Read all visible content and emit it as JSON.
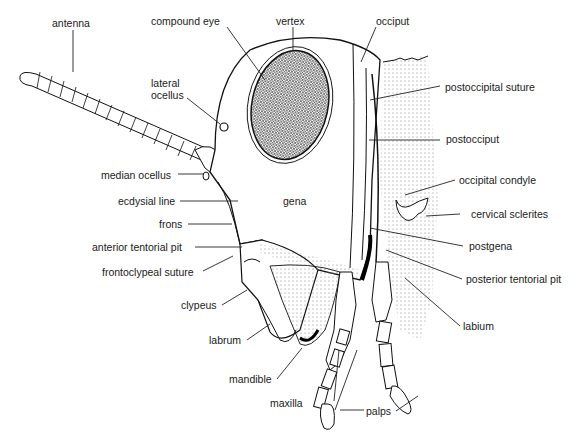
{
  "diagram": {
    "labels": {
      "antenna": "antenna",
      "compound_eye": "compound eye",
      "vertex": "vertex",
      "occiput": "occiput",
      "lateral_ocellus": "lateral\nocellus",
      "lateral_ocellus_l1": "lateral",
      "lateral_ocellus_l2": "ocellus",
      "postoccipital_suture": "postoccipital suture",
      "postocciput": "postocciput",
      "median_ocellus": "median ocellus",
      "ecdysial_line": "ecdysial line",
      "gena": "gena",
      "frons": "frons",
      "occipital_condyle": "occipital condyle",
      "cervical_sclerites": "cervical sclerites",
      "anterior_tentorial_pit": "anterior tentorial pit",
      "postgena": "postgena",
      "frontoclypeal_suture": "frontoclypeal suture",
      "posterior_tentorial_pit": "posterior tentorial pit",
      "clypeus": "clypeus",
      "labium": "labium",
      "labrum": "labrum",
      "mandible": "mandible",
      "maxilla": "maxilla",
      "palps": "palps"
    }
  }
}
